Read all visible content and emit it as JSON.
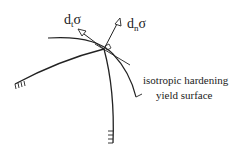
{
  "diagram": {
    "labels": {
      "tangential_increment": {
        "base": "d",
        "sub": "t",
        "symbol": "σ"
      },
      "normal_increment": {
        "base": "d",
        "sub": "n",
        "symbol": "σ"
      },
      "surface_label_line1": "isotropic hardening",
      "surface_label_line2": "yield surface"
    },
    "colors": {
      "stroke": "#222222",
      "background": "#ffffff"
    }
  }
}
